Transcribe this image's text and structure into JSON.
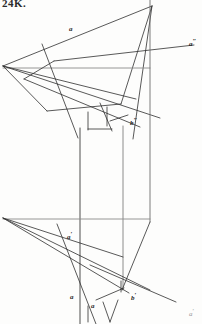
{
  "page": {
    "number_label": "24K.",
    "width": 202,
    "height": 324,
    "background": "#fdfdfc",
    "ink_color": "#262626"
  },
  "labels": [
    {
      "id": "a-top",
      "text": "a",
      "prime": "",
      "x": 69,
      "y": 26,
      "faint": false
    },
    {
      "id": "a-dprime",
      "text": "a",
      "prime": "″",
      "x": 189,
      "y": 38,
      "faint": false
    },
    {
      "id": "b-dprime",
      "text": "b",
      "prime": "″",
      "x": 130,
      "y": 117,
      "faint": false
    },
    {
      "id": "a-prime-mid",
      "text": "a",
      "prime": "′",
      "x": 67,
      "y": 231,
      "faint": false
    },
    {
      "id": "a-low-left",
      "text": "a",
      "prime": "",
      "x": 70,
      "y": 294,
      "faint": false
    },
    {
      "id": "a-low-mid",
      "text": "a",
      "prime": "",
      "x": 91,
      "y": 303,
      "faint": false
    },
    {
      "id": "b-prime",
      "text": "b",
      "prime": "′",
      "x": 131,
      "y": 292,
      "faint": false
    },
    {
      "id": "a-prime-br",
      "text": "a",
      "prime": "′",
      "x": 189,
      "y": 308,
      "faint": true
    }
  ],
  "chart_data": {
    "type": "line-drawing",
    "segments": [
      {
        "name": "upper-apex-to-left-vertex",
        "x1": 152,
        "y1": 6,
        "x2": 3,
        "y2": 66,
        "w": 0.8,
        "c": "#2e2e2e"
      },
      {
        "name": "upper-apex-to-lower-right",
        "x1": 152,
        "y1": 6,
        "x2": 121,
        "y2": 104,
        "w": 0.8,
        "c": "#2e2e2e"
      },
      {
        "name": "upper-apex-to-bl",
        "x1": 152,
        "y1": 6,
        "x2": 133,
        "y2": 139,
        "w": 0.8,
        "c": "#2e2e2e"
      },
      {
        "name": "ground-line-upper",
        "x1": 3,
        "y1": 68,
        "x2": 150,
        "y2": 68,
        "w": 0.9,
        "c": "#8a8a8a"
      },
      {
        "name": "left-vertex-to-fan-a",
        "x1": 3,
        "y1": 66,
        "x2": 136,
        "y2": 99,
        "w": 0.8,
        "c": "#2e2e2e"
      },
      {
        "name": "left-vertex-to-fan-b",
        "x1": 3,
        "y1": 66,
        "x2": 160,
        "y2": 118,
        "w": 0.8,
        "c": "#2e2e2e"
      },
      {
        "name": "left-vertex-to-fan-c",
        "x1": 3,
        "y1": 66,
        "x2": 47,
        "y2": 111,
        "w": 0.8,
        "c": "#2e2e2e"
      },
      {
        "name": "fan-c-to-apexline",
        "x1": 47,
        "y1": 111,
        "x2": 121,
        "y2": 104,
        "w": 0.8,
        "c": "#2e2e2e"
      },
      {
        "name": "steep-cross-upper",
        "x1": 42,
        "y1": 44,
        "x2": 78,
        "y2": 138,
        "w": 0.8,
        "c": "#2e2e2e"
      },
      {
        "name": "axis-a-dprime",
        "x1": 54,
        "y1": 61,
        "x2": 194,
        "y2": 45,
        "w": 0.8,
        "c": "#2e2e2e"
      },
      {
        "name": "axis-a-dprime-ext",
        "x1": 54,
        "y1": 61,
        "x2": 24,
        "y2": 79,
        "w": 0.8,
        "c": "#2e2e2e"
      },
      {
        "name": "oblique-to-b-dprime",
        "x1": 24,
        "y1": 79,
        "x2": 140,
        "y2": 127,
        "w": 0.8,
        "c": "#2e2e2e"
      },
      {
        "name": "b-dprime-tick",
        "x1": 110,
        "y1": 121,
        "x2": 128,
        "y2": 115,
        "w": 0.8,
        "c": "#2e2e2e"
      },
      {
        "name": "short-vert-1-upper",
        "x1": 88,
        "y1": 112,
        "x2": 88,
        "y2": 130,
        "w": 0.8,
        "c": "#2e2e2e"
      },
      {
        "name": "short-vert-2-upper",
        "x1": 107,
        "y1": 107,
        "x2": 107,
        "y2": 126,
        "w": 0.8,
        "c": "#2e2e2e"
      },
      {
        "name": "short-horiz-upper",
        "x1": 88,
        "y1": 129,
        "x2": 112,
        "y2": 129,
        "w": 0.8,
        "c": "#2e2e2e"
      },
      {
        "name": "curve-chord-upper",
        "x1": 100,
        "y1": 103,
        "x2": 112,
        "y2": 131,
        "w": 0.8,
        "c": "#2e2e2e"
      },
      {
        "name": "vert-left-long",
        "x1": 80,
        "y1": 128,
        "x2": 80,
        "y2": 324,
        "w": 0.9,
        "c": "#3a3a3a"
      },
      {
        "name": "vert-mid-long",
        "x1": 123,
        "y1": 126,
        "x2": 123,
        "y2": 290,
        "w": 0.8,
        "c": "#6e6e6e"
      },
      {
        "name": "vert-right-long",
        "x1": 150,
        "y1": 0,
        "x2": 150,
        "y2": 222,
        "w": 0.9,
        "c": "#6e6e6e"
      },
      {
        "name": "ground-line-lower",
        "x1": 3,
        "y1": 219,
        "x2": 150,
        "y2": 219,
        "w": 0.9,
        "c": "#8a8a8a"
      },
      {
        "name": "lower-left-to-mid-right",
        "x1": 3,
        "y1": 218,
        "x2": 123,
        "y2": 257,
        "w": 0.8,
        "c": "#2e2e2e"
      },
      {
        "name": "lower-left-to-b-prime",
        "x1": 3,
        "y1": 218,
        "x2": 150,
        "y2": 290,
        "w": 0.8,
        "c": "#2e2e2e"
      },
      {
        "name": "lower-right-edge",
        "x1": 150,
        "y1": 222,
        "x2": 122,
        "y2": 290,
        "w": 0.8,
        "c": "#2e2e2e"
      },
      {
        "name": "steep-cross-lower",
        "x1": 57,
        "y1": 224,
        "x2": 96,
        "y2": 324,
        "w": 0.8,
        "c": "#2e2e2e"
      },
      {
        "name": "axis-b-prime",
        "x1": 90,
        "y1": 265,
        "x2": 176,
        "y2": 302,
        "w": 0.8,
        "c": "#2e2e2e"
      },
      {
        "name": "oblique-lower-long",
        "x1": 3,
        "y1": 218,
        "x2": 129,
        "y2": 293,
        "w": 0.8,
        "c": "#2e2e2e"
      },
      {
        "name": "short-vert-1-lower",
        "x1": 88,
        "y1": 306,
        "x2": 88,
        "y2": 322,
        "w": 0.8,
        "c": "#2e2e2e"
      },
      {
        "name": "v-left-lower",
        "x1": 103,
        "y1": 302,
        "x2": 110,
        "y2": 322,
        "w": 0.8,
        "c": "#2e2e2e"
      },
      {
        "name": "v-right-lower",
        "x1": 110,
        "y1": 322,
        "x2": 118,
        "y2": 300,
        "w": 0.8,
        "c": "#2e2e2e"
      },
      {
        "name": "spur-to-b-prime",
        "x1": 96,
        "y1": 300,
        "x2": 124,
        "y2": 288,
        "w": 0.8,
        "c": "#2e2e2e"
      },
      {
        "name": "b-prime-tick",
        "x1": 121,
        "y1": 281,
        "x2": 121,
        "y2": 292,
        "w": 0.8,
        "c": "#2e2e2e"
      }
    ]
  }
}
